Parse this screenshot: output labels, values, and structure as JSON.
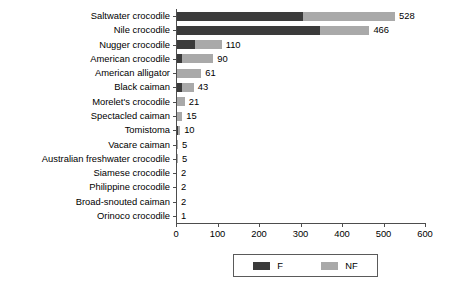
{
  "chart_data": {
    "type": "bar",
    "orientation": "horizontal",
    "stacked": true,
    "title": "",
    "xlabel": "",
    "ylabel": "",
    "xlim": [
      0,
      600
    ],
    "xticks": [
      0,
      100,
      200,
      300,
      400,
      500,
      600
    ],
    "grid": false,
    "legend_position": "bottom",
    "categories": [
      "Saltwater crocodile",
      "Nile crocodile",
      "Nugger crocodile",
      "American crocodile",
      "American alligator",
      "Black caiman",
      "Morelet's crocodile",
      "Spectacled caiman",
      "Tomistoma",
      "Vacare caiman",
      "Australian freshwater crocodile",
      "Siamese crocodile",
      "Philippine crocodile",
      "Broad-snouted caiman",
      "Orinoco crocodile"
    ],
    "series": [
      {
        "name": "F",
        "color": "#3b3b3b",
        "values": [
          305,
          347,
          45,
          15,
          0,
          14,
          0,
          0,
          5,
          0,
          0,
          0,
          0,
          0,
          0
        ]
      },
      {
        "name": "NF",
        "color": "#a9a9a9",
        "values": [
          223,
          119,
          65,
          75,
          61,
          29,
          21,
          15,
          5,
          5,
          5,
          2,
          2,
          2,
          1
        ]
      }
    ],
    "totals": [
      528,
      466,
      110,
      90,
      61,
      43,
      21,
      15,
      10,
      5,
      5,
      2,
      2,
      2,
      1
    ],
    "data_labels": [
      "528",
      "466",
      "110",
      "90",
      "61",
      "43",
      "21",
      "15",
      "10",
      "5",
      "5",
      "2",
      "2",
      "2",
      "1"
    ]
  },
  "legend": {
    "entries": [
      {
        "label": "F",
        "color": "#3b3b3b"
      },
      {
        "label": "NF",
        "color": "#a9a9a9"
      }
    ]
  }
}
